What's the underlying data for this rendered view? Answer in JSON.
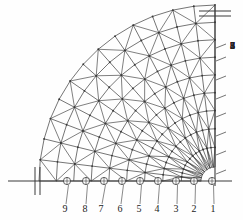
{
  "figure": {
    "type": "engineering-mesh-drawing",
    "stroke_color": "#3a3a3a",
    "label_color": "#222222",
    "background_color": "#ffffff"
  },
  "geometry": {
    "center_x": 215,
    "center_y": 181,
    "inner_radius": 14,
    "outer_radius": 176,
    "ring_count": 9,
    "sector_count": 13,
    "angle_start_deg": 0,
    "angle_end_deg": 90
  },
  "axes": {
    "baseline": {
      "name": "horizontal-baseline",
      "y": 181,
      "x_start": 8,
      "x_end": 232
    },
    "vertical_axis": {
      "name": "vertical-axis",
      "x": 215,
      "y_start": 6,
      "y_end": 186
    }
  },
  "symmetry_marks": {
    "left": {
      "x": 37,
      "y": 181,
      "orientation": "vertical-double-hatch"
    },
    "top": {
      "x": 215,
      "y": 13,
      "orientation": "horizontal-double-hatch"
    }
  },
  "bottom_nodes": {
    "axis_name": "bottom-node-axis",
    "labels": [
      "9",
      "8",
      "7",
      "6",
      "5",
      "4",
      "3",
      "2",
      "1"
    ],
    "node_x": [
      67,
      86,
      104,
      122,
      140,
      158,
      176,
      194,
      212
    ],
    "label_x": [
      65,
      85,
      101,
      120,
      139,
      157,
      176,
      194,
      213
    ],
    "label_y": 212,
    "marker": "circle-with-cross"
  },
  "right_ticks": {
    "axis_name": "right-tick-axis",
    "labels": [
      "8",
      "7",
      "6",
      "5",
      "4",
      "3",
      "2",
      "1"
    ],
    "label_y": [
      49,
      62,
      81,
      100,
      118,
      137,
      156,
      175
    ],
    "label_x": 230,
    "tick_x_start": 216,
    "tick_x_end": 226
  },
  "chart_data": {
    "type": "mesh",
    "title": "",
    "xlabel": "",
    "ylabel": "",
    "node_columns": [
      "9",
      "8",
      "7",
      "6",
      "5",
      "4",
      "3",
      "2",
      "1"
    ],
    "ring_levels": [
      "1",
      "2",
      "3",
      "4",
      "5",
      "6",
      "7",
      "8"
    ]
  }
}
